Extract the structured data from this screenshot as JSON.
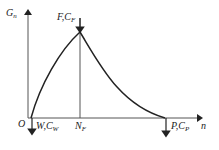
{
  "diagram": {
    "axes": {
      "y_label": "G",
      "y_label_sub": "n",
      "x_label": "n",
      "origin_label": "O"
    },
    "points": {
      "W": {
        "label": "W,C",
        "sub": "W"
      },
      "F": {
        "label": "F,C",
        "sub": "F"
      },
      "P": {
        "label": "P,C",
        "sub": "P"
      },
      "NF": {
        "label": "N",
        "sub": "F"
      }
    },
    "colors": {
      "line": "#222222",
      "axis": "#555555",
      "background": "#ffffff"
    }
  }
}
